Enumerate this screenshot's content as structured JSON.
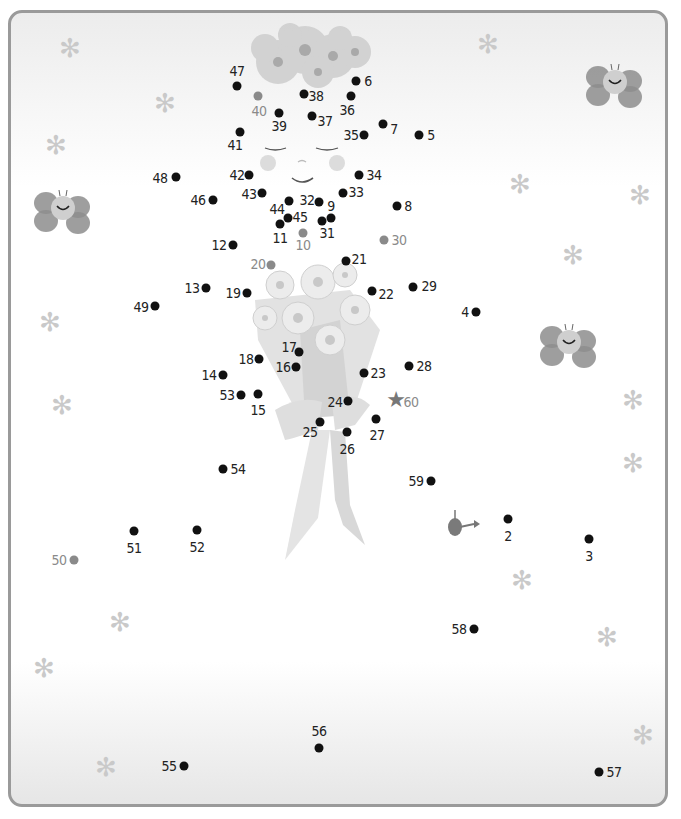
{
  "puzzle": {
    "type": "connect-the-dots",
    "subject": "girl with flower bouquet",
    "start_marker": {
      "x": 455,
      "y": 527,
      "label": "1"
    },
    "end_marker": {
      "x": 396,
      "y": 400,
      "symbol": "★",
      "label": "60"
    },
    "dots": [
      {
        "n": "2",
        "x": 508,
        "y": 519,
        "lx": 508,
        "ly": 536
      },
      {
        "n": "3",
        "x": 589,
        "y": 539,
        "lx": 589,
        "ly": 556
      },
      {
        "n": "4",
        "x": 476,
        "y": 312,
        "lx": 465,
        "ly": 312
      },
      {
        "n": "5",
        "x": 419,
        "y": 135,
        "lx": 431,
        "ly": 135
      },
      {
        "n": "6",
        "x": 356,
        "y": 81,
        "lx": 368,
        "ly": 81
      },
      {
        "n": "7",
        "x": 383,
        "y": 124,
        "lx": 394,
        "ly": 129
      },
      {
        "n": "8",
        "x": 397,
        "y": 206,
        "lx": 408,
        "ly": 206
      },
      {
        "n": "9",
        "x": 331,
        "y": 218,
        "lx": 331,
        "ly": 206
      },
      {
        "n": "10",
        "x": 303,
        "y": 233,
        "lx": 303,
        "ly": 245,
        "gray": true
      },
      {
        "n": "11",
        "x": 280,
        "y": 224,
        "lx": 280,
        "ly": 238
      },
      {
        "n": "12",
        "x": 233,
        "y": 245,
        "lx": 219,
        "ly": 245
      },
      {
        "n": "13",
        "x": 206,
        "y": 288,
        "lx": 192,
        "ly": 288
      },
      {
        "n": "14",
        "x": 223,
        "y": 375,
        "lx": 209,
        "ly": 375
      },
      {
        "n": "15",
        "x": 258,
        "y": 394,
        "lx": 258,
        "ly": 410
      },
      {
        "n": "16",
        "x": 296,
        "y": 367,
        "lx": 283,
        "ly": 367
      },
      {
        "n": "17",
        "x": 299,
        "y": 352,
        "lx": 289,
        "ly": 347
      },
      {
        "n": "18",
        "x": 259,
        "y": 359,
        "lx": 246,
        "ly": 359
      },
      {
        "n": "19",
        "x": 247,
        "y": 293,
        "lx": 233,
        "ly": 293
      },
      {
        "n": "20",
        "x": 271,
        "y": 265,
        "lx": 258,
        "ly": 264,
        "gray": true
      },
      {
        "n": "21",
        "x": 346,
        "y": 261,
        "lx": 359,
        "ly": 259
      },
      {
        "n": "22",
        "x": 372,
        "y": 291,
        "lx": 386,
        "ly": 294
      },
      {
        "n": "23",
        "x": 364,
        "y": 373,
        "lx": 378,
        "ly": 373
      },
      {
        "n": "24",
        "x": 348,
        "y": 401,
        "lx": 335,
        "ly": 402
      },
      {
        "n": "25",
        "x": 320,
        "y": 422,
        "lx": 310,
        "ly": 432
      },
      {
        "n": "26",
        "x": 347,
        "y": 432,
        "lx": 347,
        "ly": 449
      },
      {
        "n": "27",
        "x": 376,
        "y": 419,
        "lx": 377,
        "ly": 435
      },
      {
        "n": "28",
        "x": 409,
        "y": 366,
        "lx": 424,
        "ly": 366
      },
      {
        "n": "29",
        "x": 413,
        "y": 287,
        "lx": 429,
        "ly": 286
      },
      {
        "n": "30",
        "x": 384,
        "y": 240,
        "lx": 399,
        "ly": 240,
        "gray": true
      },
      {
        "n": "31",
        "x": 322,
        "y": 221,
        "lx": 327,
        "ly": 233
      },
      {
        "n": "32",
        "x": 319,
        "y": 202,
        "lx": 307,
        "ly": 200
      },
      {
        "n": "33",
        "x": 343,
        "y": 193,
        "lx": 356,
        "ly": 192
      },
      {
        "n": "34",
        "x": 359,
        "y": 175,
        "lx": 374,
        "ly": 175
      },
      {
        "n": "35",
        "x": 364,
        "y": 135,
        "lx": 351,
        "ly": 135
      },
      {
        "n": "36",
        "x": 351,
        "y": 96,
        "lx": 347,
        "ly": 110
      },
      {
        "n": "37",
        "x": 312,
        "y": 116,
        "lx": 325,
        "ly": 121
      },
      {
        "n": "38",
        "x": 304,
        "y": 94,
        "lx": 316,
        "ly": 96
      },
      {
        "n": "39",
        "x": 279,
        "y": 113,
        "lx": 279,
        "ly": 126
      },
      {
        "n": "40",
        "x": 258,
        "y": 96,
        "lx": 259,
        "ly": 111,
        "gray": true
      },
      {
        "n": "41",
        "x": 240,
        "y": 132,
        "lx": 235,
        "ly": 145
      },
      {
        "n": "42",
        "x": 249,
        "y": 175,
        "lx": 237,
        "ly": 175
      },
      {
        "n": "43",
        "x": 262,
        "y": 193,
        "lx": 249,
        "ly": 194
      },
      {
        "n": "44",
        "x": 289,
        "y": 201,
        "lx": 277,
        "ly": 209
      },
      {
        "n": "45",
        "x": 288,
        "y": 218,
        "lx": 300,
        "ly": 217
      },
      {
        "n": "46",
        "x": 213,
        "y": 200,
        "lx": 198,
        "ly": 200
      },
      {
        "n": "47",
        "x": 237,
        "y": 86,
        "lx": 237,
        "ly": 71
      },
      {
        "n": "48",
        "x": 176,
        "y": 177,
        "lx": 160,
        "ly": 178
      },
      {
        "n": "49",
        "x": 155,
        "y": 306,
        "lx": 141,
        "ly": 307
      },
      {
        "n": "50",
        "x": 74,
        "y": 560,
        "lx": 59,
        "ly": 560,
        "gray": true
      },
      {
        "n": "51",
        "x": 134,
        "y": 531,
        "lx": 134,
        "ly": 548
      },
      {
        "n": "52",
        "x": 197,
        "y": 530,
        "lx": 197,
        "ly": 547
      },
      {
        "n": "53",
        "x": 241,
        "y": 395,
        "lx": 227,
        "ly": 395
      },
      {
        "n": "54",
        "x": 223,
        "y": 469,
        "lx": 238,
        "ly": 469
      },
      {
        "n": "55",
        "x": 184,
        "y": 766,
        "lx": 169,
        "ly": 766
      },
      {
        "n": "56",
        "x": 319,
        "y": 748,
        "lx": 319,
        "ly": 731
      },
      {
        "n": "57",
        "x": 599,
        "y": 772,
        "lx": 614,
        "ly": 772
      },
      {
        "n": "58",
        "x": 474,
        "y": 629,
        "lx": 459,
        "ly": 629
      },
      {
        "n": "59",
        "x": 431,
        "y": 481,
        "lx": 416,
        "ly": 481
      }
    ]
  },
  "decorations": {
    "flowers": [
      {
        "x": 70,
        "y": 48
      },
      {
        "x": 488,
        "y": 44
      },
      {
        "x": 165,
        "y": 103
      },
      {
        "x": 56,
        "y": 145
      },
      {
        "x": 520,
        "y": 184
      },
      {
        "x": 640,
        "y": 195
      },
      {
        "x": 573,
        "y": 255
      },
      {
        "x": 50,
        "y": 322
      },
      {
        "x": 62,
        "y": 405
      },
      {
        "x": 633,
        "y": 400
      },
      {
        "x": 633,
        "y": 463
      },
      {
        "x": 522,
        "y": 580
      },
      {
        "x": 120,
        "y": 622
      },
      {
        "x": 607,
        "y": 637
      },
      {
        "x": 44,
        "y": 668
      },
      {
        "x": 106,
        "y": 767
      },
      {
        "x": 643,
        "y": 735
      }
    ],
    "bees": [
      {
        "x": 34,
        "y": 188
      },
      {
        "x": 586,
        "y": 62
      },
      {
        "x": 540,
        "y": 322
      }
    ]
  }
}
